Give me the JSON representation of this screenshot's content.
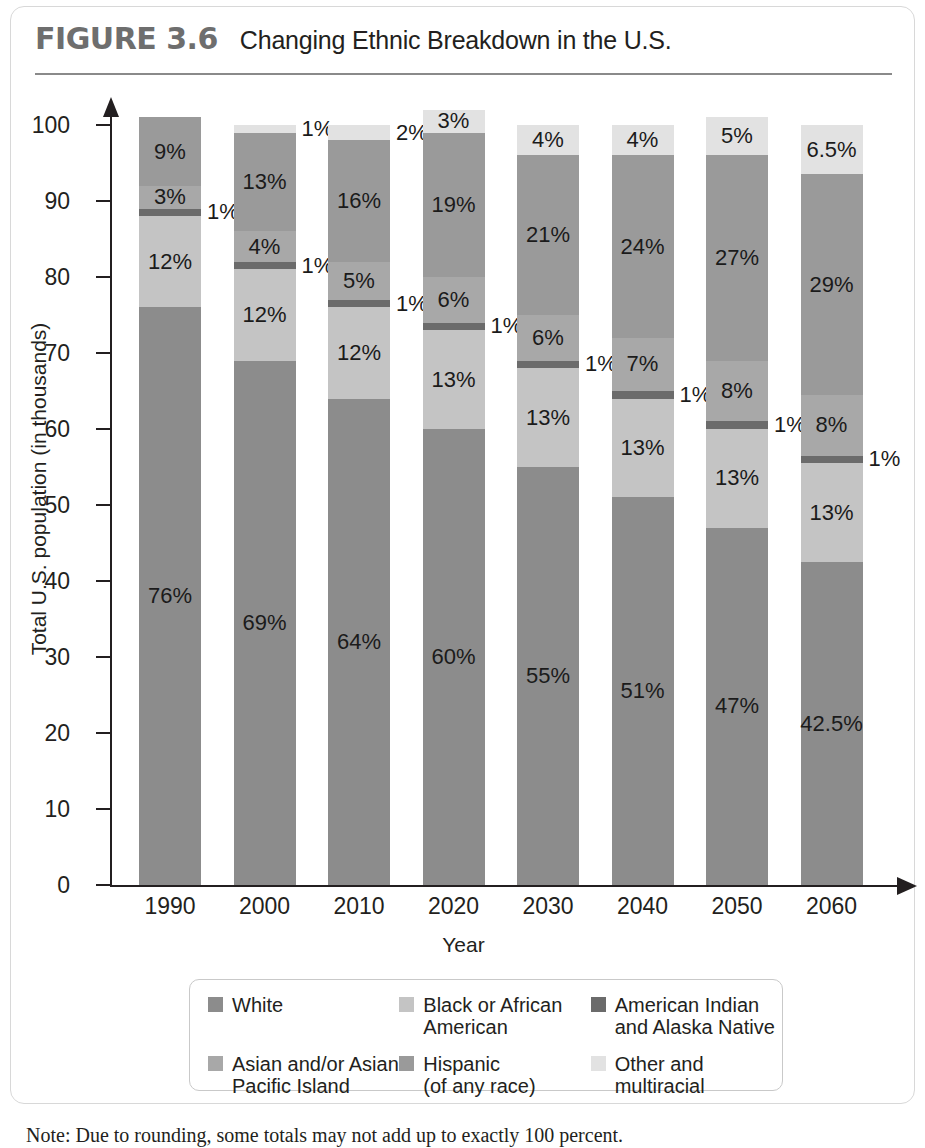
{
  "figure": {
    "number": "FIGURE 3.6",
    "title": "Changing Ethnic Breakdown in the U.S.",
    "note": "Note: Due to rounding, some totals may not add up to exactly 100 percent."
  },
  "colors": {
    "white": "#8c8c8c",
    "black": "#c4c4c4",
    "american_indian": "#6b6b6b",
    "asian": "#a8a8a8",
    "hispanic": "#9a9a9a",
    "other": "#e2e2e2",
    "axis": "#231f20",
    "rule": "#8a8a8a"
  },
  "axes": {
    "y_title": "Total U.S. population (in thousands)",
    "x_title": "Year",
    "y_ticks": [
      "0",
      "10",
      "20",
      "30",
      "40",
      "50",
      "60",
      "70",
      "80",
      "90",
      "100"
    ],
    "y_min": 0,
    "y_max": 100
  },
  "legend": {
    "rows": [
      [
        {
          "key": "white",
          "label": "White"
        },
        {
          "key": "black",
          "label": "Black or African\nAmerican"
        },
        {
          "key": "american_indian",
          "label": "American Indian\nand Alaska Native"
        }
      ],
      [
        {
          "key": "asian",
          "label": "Asian and/or Asian\nPacific Island"
        },
        {
          "key": "hispanic",
          "label": "Hispanic\n(of any race)"
        },
        {
          "key": "other",
          "label": "Other and\nmultiracial"
        }
      ]
    ]
  },
  "chart_data": {
    "type": "bar",
    "stacked": true,
    "title": "Changing Ethnic Breakdown in the U.S.",
    "xlabel": "Year",
    "ylabel": "Total U.S. population (in thousands)",
    "ylim": [
      0,
      100
    ],
    "grid": false,
    "legend_position": "bottom",
    "categories": [
      "1990",
      "2000",
      "2010",
      "2020",
      "2030",
      "2040",
      "2050",
      "2060"
    ],
    "series": [
      {
        "name": "White",
        "key": "white",
        "values": [
          76,
          69,
          64,
          60,
          55,
          51,
          47,
          42.5
        ],
        "labels": [
          "76%",
          "69%",
          "64%",
          "60%",
          "55%",
          "51%",
          "47%",
          "42.5%"
        ]
      },
      {
        "name": "Black or African American",
        "key": "black",
        "values": [
          12,
          12,
          12,
          13,
          13,
          13,
          13,
          13
        ],
        "labels": [
          "12%",
          "12%",
          "12%",
          "13%",
          "13%",
          "13%",
          "13%",
          "13%"
        ]
      },
      {
        "name": "American Indian and Alaska Native",
        "key": "american_indian",
        "values": [
          1,
          1,
          1,
          1,
          1,
          1,
          1,
          1
        ],
        "labels": [
          "1%",
          "1%",
          "1%",
          "1%",
          "1%",
          "1%",
          "1%",
          "1%"
        ]
      },
      {
        "name": "Asian and/or Asian Pacific Island",
        "key": "asian",
        "values": [
          3,
          4,
          5,
          6,
          6,
          7,
          8,
          8
        ],
        "labels": [
          "3%",
          "4%",
          "5%",
          "6%",
          "6%",
          "7%",
          "8%",
          "8%"
        ]
      },
      {
        "name": "Hispanic (of any race)",
        "key": "hispanic",
        "values": [
          9,
          13,
          16,
          19,
          21,
          24,
          27,
          29
        ],
        "labels": [
          "9%",
          "13%",
          "16%",
          "19%",
          "21%",
          "24%",
          "27%",
          "29%"
        ]
      },
      {
        "name": "Other and multiracial",
        "key": "other",
        "values": [
          0,
          1,
          2,
          3,
          4,
          4,
          5,
          6.5
        ],
        "labels": [
          "",
          "1%",
          "2%",
          "3%",
          "4%",
          "4%",
          "5%",
          "6.5%"
        ]
      }
    ]
  }
}
